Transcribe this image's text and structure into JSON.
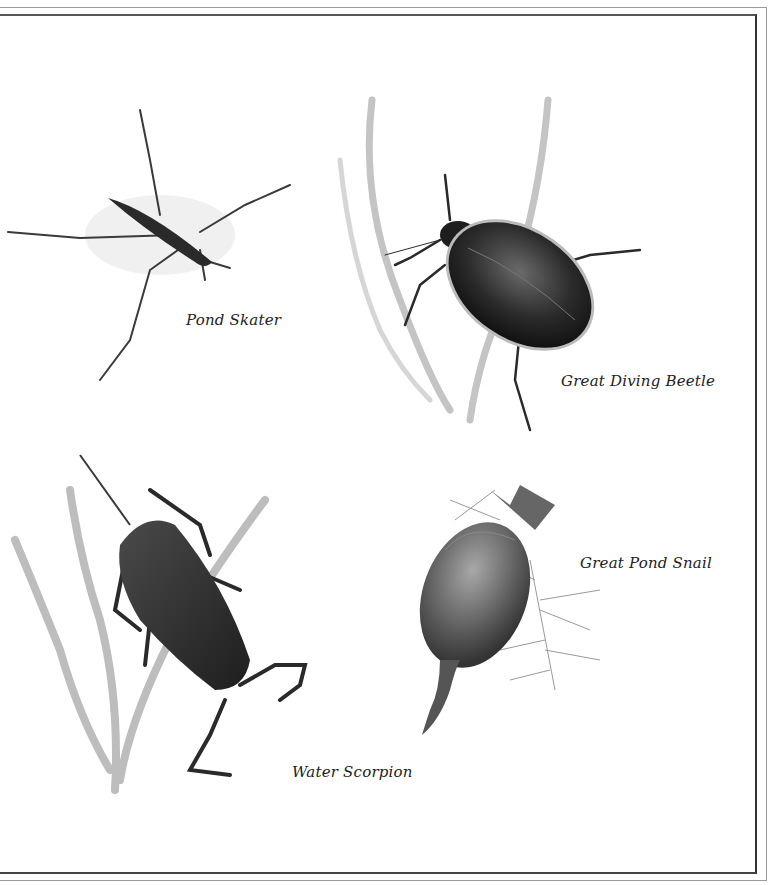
{
  "illustration": {
    "subject": "Pond insects and snail plate",
    "specimens": [
      {
        "id": "pond-skater",
        "label": "Pond Skater"
      },
      {
        "id": "great-diving-beetle",
        "label": "Great Diving Beetle"
      },
      {
        "id": "water-scorpion",
        "label": "Water Scorpion"
      },
      {
        "id": "great-pond-snail",
        "label": "Great Pond Snail"
      }
    ]
  },
  "colors": {
    "background": "#ffffff",
    "ink": "#222222",
    "weed": "#b8b8b8",
    "body_dark": "#2a2a2a"
  }
}
